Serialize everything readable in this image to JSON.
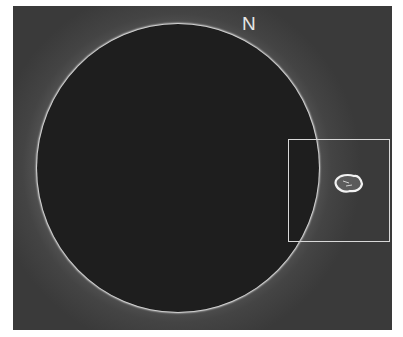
{
  "image": {
    "description": "Solar eclipse with bright corona and a prominence on the right limb",
    "label": "N",
    "highlight_box": {
      "color": "#d8d8d8"
    },
    "colors": {
      "sky": "#3a3a3a",
      "moon": "#1e1e1e",
      "corona": "#ffffff"
    }
  }
}
